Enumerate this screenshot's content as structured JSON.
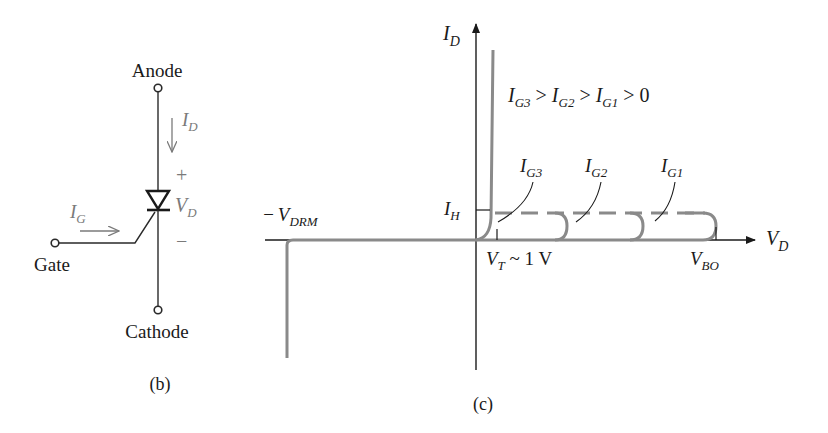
{
  "panel_b": {
    "caption": "(b)",
    "anode_label": "Anode",
    "cathode_label": "Cathode",
    "gate_label": "Gate",
    "id_label": {
      "main": "I",
      "sub": "D"
    },
    "ig_label": {
      "main": "I",
      "sub": "G"
    },
    "vd_label": {
      "main": "V",
      "sub": "D"
    },
    "plus": "+",
    "minus": "−",
    "colors": {
      "wire": "#2a2a2a",
      "annotation": "#7a7a7a"
    }
  },
  "panel_c": {
    "caption": "(c)",
    "y_axis_label": {
      "main": "I",
      "sub": "D"
    },
    "x_axis_label": {
      "main": "V",
      "sub": "D"
    },
    "relation": {
      "a": "I",
      "a_sub": "G3",
      "b": "I",
      "b_sub": "G2",
      "c": "I",
      "c_sub": "G1",
      "text": " > ",
      "tail": "0"
    },
    "curve_labels": [
      {
        "main": "I",
        "sub": "G3"
      },
      {
        "main": "I",
        "sub": "G2"
      },
      {
        "main": "I",
        "sub": "G1"
      }
    ],
    "ih_label": {
      "main": "I",
      "sub": "H"
    },
    "vt_label": {
      "main": "V",
      "sub": "T",
      "suffix": " ~ 1 V"
    },
    "vbo_label": {
      "main": "V",
      "sub": "BO"
    },
    "vdrm_label": {
      "prefix": "−",
      "main": "V",
      "sub": "DRM"
    },
    "colors": {
      "axis": "#1a1a1a",
      "curve": "#8a8a8a"
    }
  }
}
